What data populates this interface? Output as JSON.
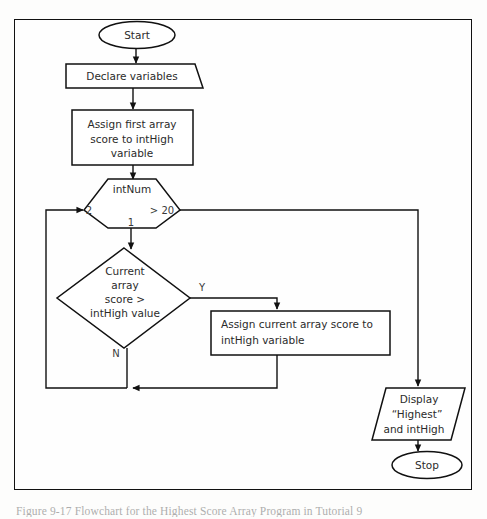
{
  "figure": {
    "caption": "Figure 9-17  Flowchart for the Highest Score Array Program in Tutorial 9"
  },
  "flowchart": {
    "title": "Highest score array flowchart",
    "nodes": [
      {
        "id": "start",
        "type": "terminator",
        "label": "Start"
      },
      {
        "id": "declare",
        "type": "process-folded",
        "label": "Declare variables"
      },
      {
        "id": "assign-first",
        "type": "process",
        "lines": [
          "Assign first array",
          "score to intHigh",
          "variable"
        ]
      },
      {
        "id": "loop",
        "type": "hexagon-loop",
        "label": "intNum",
        "start_value": "1",
        "step_value": "2",
        "condition": "> 20"
      },
      {
        "id": "compare",
        "type": "decision",
        "lines": [
          "Current",
          "array",
          "score >",
          "intHigh value"
        ],
        "yes_label": "Y",
        "no_label": "N"
      },
      {
        "id": "assign-current",
        "type": "process",
        "lines": [
          "Assign current array score to",
          "intHigh variable"
        ]
      },
      {
        "id": "display",
        "type": "input-output",
        "lines": [
          "Display",
          "“Highest”",
          "and intHigh"
        ]
      },
      {
        "id": "stop",
        "type": "terminator",
        "label": "Stop"
      }
    ]
  },
  "colors": {
    "line": "#111111",
    "text": "#2b2b2b",
    "page_background": "#fdfdfc",
    "shape_fill": "#ffffff"
  }
}
